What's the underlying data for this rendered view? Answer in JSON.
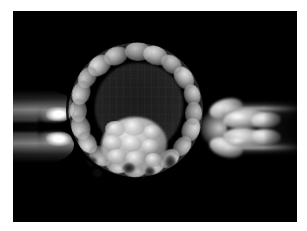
{
  "image": {
    "title": "Blastocyst held by holding pipette during trophectoderm biopsy",
    "modality": "Light microscopy / Hoffman modulation contrast",
    "color_mode": "grayscale",
    "caption": "",
    "frame": {
      "outer_background": "#ffffff",
      "panel_background": "#000000",
      "panel_left": 13,
      "panel_top": 11,
      "panel_width": 284,
      "panel_height": 211
    }
  },
  "subject": {
    "name": "blastocyst",
    "stage": "expanded blastocyst",
    "center_x": 123,
    "center_y": 99,
    "radius": 75,
    "structures": [
      {
        "name": "zona-pellucida",
        "description": "thin bright outer shell ring surrounding the embryo",
        "tone": "#f0f0f0"
      },
      {
        "name": "perivitelline-space",
        "description": "dark narrow gap between zona pellucida and trophectoderm",
        "tone": "#0a0a0a"
      },
      {
        "name": "trophectoderm",
        "description": "ring of flattened polygonal outer cells lining the zona",
        "tone": "#c8c8c8"
      },
      {
        "name": "blastocoel",
        "description": "large dark fluid-filled central cavity",
        "tone": "#222222"
      },
      {
        "name": "inner-cell-mass",
        "description": "compacted cluster of rounded cells at lower-left of the cavity",
        "tone": "#d2d2d2"
      }
    ]
  },
  "instruments": [
    {
      "name": "holding-pipette",
      "side": "left",
      "description": "blunt suction pipette with two bright specular highlights gripping the embryo",
      "highlight_tone": "#ffffff"
    },
    {
      "name": "biopsy-pipette",
      "side": "right",
      "description": "narrow tube into which trophectoderm cells herniate and are aspirated",
      "lumen_tone": "#121212"
    }
  ],
  "herniating_cells": {
    "name": "trophectoderm-biopsy-lobes",
    "count": 4,
    "description": "four bright rounded cell lobes drawn out of the zona into the pipette"
  },
  "cells": {
    "trophectoderm_ring": [
      {
        "angle": 272,
        "size": 26
      },
      {
        "angle": 250,
        "size": 24
      },
      {
        "angle": 231,
        "size": 25
      },
      {
        "angle": 214,
        "size": 23
      },
      {
        "angle": 197,
        "size": 24
      },
      {
        "angle": 180,
        "size": 23
      },
      {
        "angle": 163,
        "size": 25
      },
      {
        "angle": 146,
        "size": 23
      },
      {
        "angle": 128,
        "size": 24
      },
      {
        "angle": 110,
        "size": 23
      },
      {
        "angle": 92,
        "size": 25
      },
      {
        "angle": 74,
        "size": 24
      },
      {
        "angle": 56,
        "size": 23
      },
      {
        "angle": 38,
        "size": 22
      },
      {
        "angle": 20,
        "size": 24
      },
      {
        "angle": 3,
        "size": 23
      },
      {
        "angle": 345,
        "size": 22
      },
      {
        "angle": 326,
        "size": 24
      },
      {
        "angle": 308,
        "size": 23
      },
      {
        "angle": 290,
        "size": 25
      }
    ],
    "inner_mass_cells": 9
  },
  "chart_data": null
}
